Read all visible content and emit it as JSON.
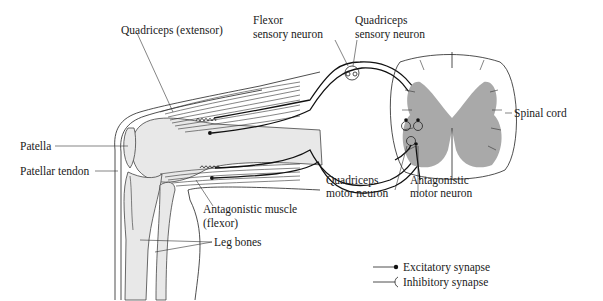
{
  "figure": {
    "labels": {
      "quadriceps_extensor": "Quadriceps (extensor)",
      "flexor_sensory_neuron_line1": "Flexor",
      "flexor_sensory_neuron_line2": "sensory neuron",
      "quadriceps_sensory_neuron_line1": "Quadriceps",
      "quadriceps_sensory_neuron_line2": "sensory neuron",
      "spinal_cord": "Spinal cord",
      "patella": "Patella",
      "patellar_tendon": "Patellar tendon",
      "quadriceps_motor_neuron_line1": "Quadriceps",
      "quadriceps_motor_neuron_line2": "motor neuron",
      "antagonistic_motor_neuron_line1": "Antagonistic",
      "antagonistic_motor_neuron_line2": "motor neuron",
      "antagonistic_muscle_line1": "Antagonistic muscle",
      "antagonistic_muscle_line2": "(flexor)",
      "leg_bones": "Leg bones"
    },
    "legend": {
      "items": [
        {
          "symbol": "dot-terminal",
          "label": "Excitatory synapse"
        },
        {
          "symbol": "fork-terminal",
          "label": "Inhibitory synapse"
        }
      ]
    },
    "colors": {
      "line": "#222222",
      "gray_matter": "#a9a9a9",
      "bone_fill": "#e8e8e8",
      "background": "#ffffff"
    }
  }
}
